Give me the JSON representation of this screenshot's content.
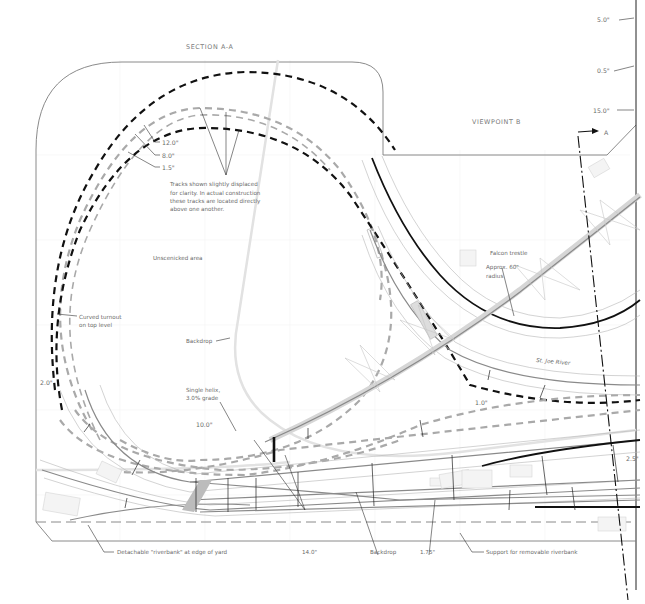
{
  "section_title": "SECTION A-A",
  "viewpoint_label": "VIEWPOINT B",
  "section_marker": "A",
  "elevations_right": [
    "5.0\"",
    "0.5\"",
    "15.0\""
  ],
  "helix_levels": [
    "12.0\"",
    "8.0\"",
    "1.5\""
  ],
  "helix_note": [
    "Tracks shown slightly displaced",
    "for clarity. In actual construction",
    "these tracks are located directly",
    "above one another."
  ],
  "unscenicked_label": "Unscenicked area",
  "curved_turnout": [
    "Curved turnout",
    "on top level"
  ],
  "backdrop_label_upper": "Backdrop",
  "single_helix": [
    "Single helix,",
    "3.0% grade"
  ],
  "elev_2_0": "2.0\"",
  "elev_10_0": "10.0\"",
  "elev_1_0": "1.0\"",
  "elev_2_5": "2.5\"",
  "falcon_trestle": "Falcon trestle",
  "approx_radius": [
    "Approx. 60\"",
    "radius"
  ],
  "river_label": "St. Joe River",
  "bottom_labels": {
    "riverbank": "Detachable \"riverbank\" at edge of yard",
    "elev_14": "14.0\"",
    "backdrop": "Backdrop",
    "elev_1_75": "1.75\"",
    "support": "Support for removable riverbank"
  },
  "colors": {
    "outline": "#7d7d7d",
    "track_dark": "#111111",
    "track_gray": "#a9a9a9",
    "label": "#6a6a6a"
  }
}
